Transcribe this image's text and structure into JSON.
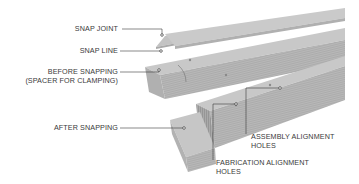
{
  "diagram": {
    "labels": {
      "snap_joint": "SNAP JOINT",
      "snap_line": "SNAP LINE",
      "before_snapping_line1": "BEFORE SNAPPING",
      "before_snapping_line2": "(SPACER FOR CLAMPING)",
      "after_snapping": "AFTER SNAPPING",
      "assembly_alignment_line1": "ASSEMBLY ALIGNMENT",
      "assembly_alignment_line2": "HOLES",
      "fabrication_alignment_line1": "FABRICATION ALIGNMENT",
      "fabrication_alignment_line2": "HOLES"
    },
    "colors": {
      "board_top": "#c9c9c9",
      "board_side": "#b3b3b3",
      "board_end": "#a9a9a9",
      "leader_line": "#3a3a3a",
      "label_text": "#3a3a3a"
    }
  }
}
